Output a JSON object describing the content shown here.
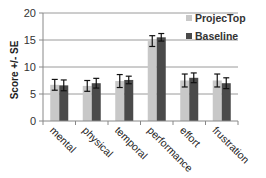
{
  "chart_data": {
    "type": "bar",
    "title": "",
    "xlabel": "",
    "ylabel": "Score +/- SE",
    "ylim": [
      0,
      20
    ],
    "yticks": [
      0,
      5,
      10,
      15,
      20
    ],
    "grid": true,
    "legend_position": "top-right",
    "categories": [
      "mental",
      "physical",
      "temporal",
      "performance",
      "effort",
      "frustration"
    ],
    "series": [
      {
        "name": "ProjecTop",
        "color": "#c8c8c8",
        "values": [
          6.7,
          6.5,
          7.4,
          14.8,
          7.5,
          7.5
        ],
        "errors": [
          1.0,
          1.0,
          1.2,
          1.0,
          1.2,
          1.2
        ]
      },
      {
        "name": "Baseline",
        "color": "#4a4a4a",
        "values": [
          6.6,
          7.0,
          7.6,
          15.5,
          8.0,
          7.0
        ],
        "errors": [
          1.0,
          0.9,
          0.7,
          0.7,
          0.9,
          1.0
        ]
      }
    ]
  }
}
